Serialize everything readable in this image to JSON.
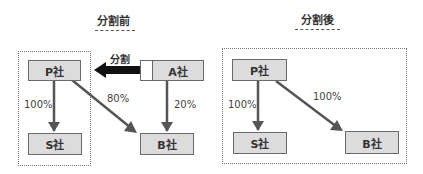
{
  "before": {
    "title": "分割前",
    "split_label": "分割",
    "companies": {
      "p": "P社",
      "a": "A社",
      "s": "S社",
      "b": "B社"
    },
    "edges": [
      {
        "from": "P社",
        "to": "S社",
        "label": "100%"
      },
      {
        "from": "P社",
        "to": "B社",
        "label": "80%"
      },
      {
        "from": "A社",
        "to": "B社",
        "label": "20%"
      },
      {
        "from": "A社",
        "to": "P社",
        "label": "分割",
        "style": "thick"
      }
    ]
  },
  "after": {
    "title": "分割後",
    "companies": {
      "p": "P社",
      "s": "S社",
      "b": "B社"
    },
    "edges": [
      {
        "from": "P社",
        "to": "S社",
        "label": "100%"
      },
      {
        "from": "P社",
        "to": "B社",
        "label": "100%"
      }
    ]
  },
  "colors": {
    "box_fill": "#dcdcdc",
    "box_border": "#6a6a6a",
    "arrow": "#555555",
    "split_arrow": "#111111"
  }
}
